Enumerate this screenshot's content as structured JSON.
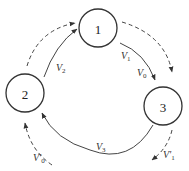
{
  "nodes": [
    {
      "id": "1",
      "label": "1"
    },
    {
      "id": "2",
      "label": "2"
    },
    {
      "id": "3",
      "label": "3"
    }
  ],
  "edges": {
    "v1": {
      "base": "V",
      "sub": "1",
      "from": "1",
      "to": "3",
      "style": "solid"
    },
    "v0": {
      "base": "V",
      "sub": "0",
      "from": "1",
      "to": "3",
      "style": "solid"
    },
    "v2": {
      "base": "V",
      "sub": "2",
      "from": "2",
      "to": "1",
      "style": "solid"
    },
    "v3": {
      "base": "V",
      "sub": "3",
      "from": "3",
      "to": "2",
      "style": "solid"
    },
    "v1_prime": {
      "base": "V'",
      "sub": "1",
      "from": "3",
      "to": "out",
      "style": "dashed"
    },
    "v0_prime": {
      "base": "V'",
      "sub": "0",
      "from": "in",
      "to": "2",
      "style": "dashed"
    }
  },
  "colors": {
    "stroke": "#444444",
    "background": "#ffffff"
  }
}
